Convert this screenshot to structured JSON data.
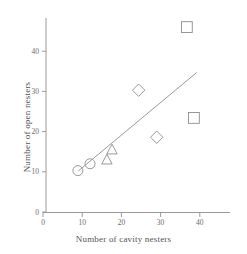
{
  "chart_data": {
    "type": "scatter",
    "title": "",
    "xlabel": "Number of cavity nesters",
    "ylabel": "Number of open nesters",
    "xlim": [
      0,
      47
    ],
    "ylim": [
      0,
      50
    ],
    "xticks": [
      0,
      10,
      20,
      30,
      40
    ],
    "yticks": [
      0,
      10,
      20,
      30,
      40
    ],
    "xticklabels": [
      "0",
      "10",
      "20",
      "30",
      "40"
    ],
    "yticklabels": [
      "0",
      "10",
      "20",
      "30",
      "40"
    ],
    "grid": false,
    "legend": false,
    "points": [
      {
        "x": 8.9,
        "y": 10.3,
        "marker": "circle"
      },
      {
        "x": 12.0,
        "y": 12.0,
        "marker": "circle"
      },
      {
        "x": 16.3,
        "y": 13.0,
        "marker": "triangle"
      },
      {
        "x": 17.6,
        "y": 15.5,
        "marker": "triangle"
      },
      {
        "x": 24.4,
        "y": 30.3,
        "marker": "diamond"
      },
      {
        "x": 29.0,
        "y": 18.6,
        "marker": "diamond"
      },
      {
        "x": 36.7,
        "y": 46.0,
        "marker": "square"
      },
      {
        "x": 38.5,
        "y": 23.4,
        "marker": "square"
      }
    ],
    "fit_line": {
      "x0": 9.0,
      "y0": 10.2,
      "x1": 39.2,
      "y1": 34.7
    }
  },
  "style": {
    "axis_color": "#9a9a9a",
    "marker_color": "#8d8d8d",
    "line_color": "#8d8d8d",
    "text_color": "#555555"
  }
}
